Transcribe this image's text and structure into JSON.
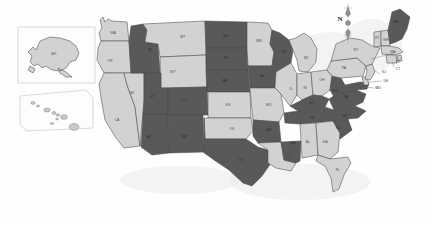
{
  "map": {
    "title": "United States choropleth map",
    "projection_note": "contiguous US with Alaska and Hawaii insets",
    "compass": {
      "label": "N",
      "name": "compass-rose"
    },
    "insets": [
      {
        "id": "alaska",
        "label": "AK",
        "fill": "light"
      },
      {
        "id": "hawaii",
        "label": "HI",
        "fill": "light"
      }
    ],
    "colors": {
      "dark": "#595959",
      "light": "#d2d2d2",
      "border": "#4a4a4a",
      "background": "#fefefe",
      "inset_border": "#c8c8c8",
      "label_on_dark": "#2b2b2b",
      "label_on_light": "#4e4e4e"
    },
    "legend_categories": [
      {
        "key": "dark",
        "color": "#595959"
      },
      {
        "key": "light",
        "color": "#d2d2d2"
      }
    ],
    "states": [
      {
        "abbr": "WA",
        "fill": "light",
        "lx": 113,
        "ly": 33
      },
      {
        "abbr": "OR",
        "fill": "light",
        "lx": 110,
        "ly": 61
      },
      {
        "abbr": "CA",
        "fill": "light",
        "lx": 117,
        "ly": 120
      },
      {
        "abbr": "NV",
        "fill": "light",
        "lx": 132,
        "ly": 93
      },
      {
        "abbr": "ID",
        "fill": "dark",
        "lx": 150,
        "ly": 50
      },
      {
        "abbr": "MT",
        "fill": "light",
        "lx": 183,
        "ly": 37
      },
      {
        "abbr": "WY",
        "fill": "light",
        "lx": 173,
        "ly": 72
      },
      {
        "abbr": "UT",
        "fill": "dark",
        "lx": 152,
        "ly": 97
      },
      {
        "abbr": "CO",
        "fill": "dark",
        "lx": 184,
        "ly": 101
      },
      {
        "abbr": "AZ",
        "fill": "dark",
        "lx": 149,
        "ly": 137
      },
      {
        "abbr": "NM",
        "fill": "dark",
        "lx": 184,
        "ly": 137
      },
      {
        "abbr": "ND",
        "fill": "dark",
        "lx": 226,
        "ly": 36
      },
      {
        "abbr": "SD",
        "fill": "dark",
        "lx": 226,
        "ly": 58
      },
      {
        "abbr": "NE",
        "fill": "dark",
        "lx": 225,
        "ly": 81
      },
      {
        "abbr": "KS",
        "fill": "light",
        "lx": 228,
        "ly": 105
      },
      {
        "abbr": "OK",
        "fill": "light",
        "lx": 232,
        "ly": 129
      },
      {
        "abbr": "TX",
        "fill": "dark",
        "lx": 241,
        "ly": 160
      },
      {
        "abbr": "MN",
        "fill": "light",
        "lx": 259,
        "ly": 41
      },
      {
        "abbr": "IA",
        "fill": "dark",
        "lx": 262,
        "ly": 76
      },
      {
        "abbr": "MO",
        "fill": "light",
        "lx": 269,
        "ly": 105
      },
      {
        "abbr": "AR",
        "fill": "dark",
        "lx": 269,
        "ly": 130
      },
      {
        "abbr": "LA",
        "fill": "light",
        "lx": 288,
        "ly": 158
      },
      {
        "abbr": "WI",
        "fill": "dark",
        "lx": 284,
        "ly": 52
      },
      {
        "abbr": "IL",
        "fill": "light",
        "lx": 291,
        "ly": 89
      },
      {
        "abbr": "MS",
        "fill": "dark",
        "lx": 293,
        "ly": 143
      },
      {
        "abbr": "MI",
        "fill": "light",
        "lx": 306,
        "ly": 58
      },
      {
        "abbr": "IN",
        "fill": "light",
        "lx": 305,
        "ly": 88
      },
      {
        "abbr": "KY",
        "fill": "dark",
        "lx": 312,
        "ly": 103
      },
      {
        "abbr": "TN",
        "fill": "dark",
        "lx": 312,
        "ly": 118
      },
      {
        "abbr": "AL",
        "fill": "light",
        "lx": 308,
        "ly": 142
      },
      {
        "abbr": "FL",
        "fill": "light",
        "lx": 338,
        "ly": 170
      },
      {
        "abbr": "GA",
        "fill": "light",
        "lx": 325,
        "ly": 142
      },
      {
        "abbr": "OH",
        "fill": "light",
        "lx": 322,
        "ly": 80
      },
      {
        "abbr": "WV",
        "fill": "dark",
        "lx": 335,
        "ly": 91
      },
      {
        "abbr": "SC",
        "fill": "dark",
        "lx": 338,
        "ly": 128
      },
      {
        "abbr": "NC",
        "fill": "dark",
        "lx": 345,
        "ly": 116
      },
      {
        "abbr": "VA",
        "fill": "dark",
        "lx": 346,
        "ly": 97
      },
      {
        "abbr": "PA",
        "fill": "light",
        "lx": 344,
        "ly": 68
      },
      {
        "abbr": "NY",
        "fill": "light",
        "lx": 356,
        "ly": 50
      },
      {
        "abbr": "ME",
        "fill": "dark",
        "lx": 396,
        "ly": 22
      },
      {
        "abbr": "VT",
        "fill": "light",
        "lx": 377,
        "ly": 38
      },
      {
        "abbr": "NH",
        "fill": "light",
        "lx": 386,
        "ly": 40
      },
      {
        "abbr": "MA",
        "fill": "light",
        "lx": 393,
        "ly": 52
      },
      {
        "abbr": "RI",
        "fill": "light",
        "lx": 398,
        "ly": 62
      },
      {
        "abbr": "CT",
        "fill": "light",
        "lx": 398,
        "ly": 69
      },
      {
        "abbr": "NJ",
        "fill": "light",
        "lx": 384,
        "ly": 72
      },
      {
        "abbr": "DE",
        "fill": "light",
        "lx": 386,
        "ly": 81
      },
      {
        "abbr": "MD",
        "fill": "dark",
        "lx": 378,
        "ly": 88
      }
    ]
  }
}
